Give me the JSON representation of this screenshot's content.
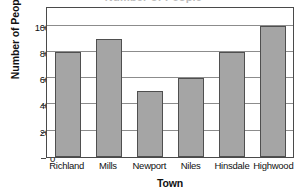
{
  "chart_data": {
    "type": "bar",
    "title": "Number of People",
    "subtitle": "",
    "xlabel": "Town",
    "ylabel": "Number of People",
    "categories": [
      "Richland",
      "Mills",
      "Newport",
      "Niles",
      "Hinsdale",
      "Highwood"
    ],
    "values": [
      800,
      900,
      500,
      600,
      800,
      1000
    ],
    "series": [
      {
        "name": "Number of People",
        "values": [
          800,
          900,
          500,
          600,
          800,
          1000
        ]
      }
    ],
    "yticks": [
      0,
      200,
      400,
      600,
      800,
      1000
    ],
    "ytick_labels": [
      "0",
      "200",
      "400",
      "600",
      "800",
      "1000"
    ],
    "ylim": [
      0,
      1150
    ],
    "xlim_categories": 6,
    "grid": "horizontal",
    "legend": "none",
    "orientation": "vertical",
    "bar_color": "#a5a5a5",
    "bar_edge_color": "#4f4f4f",
    "axis_color": "#4a4a4a",
    "grid_color": "#8c8c8c",
    "background_color": "#ffffff",
    "annotations": []
  },
  "figure": {
    "cropped_title_fragment": "Number of People"
  }
}
